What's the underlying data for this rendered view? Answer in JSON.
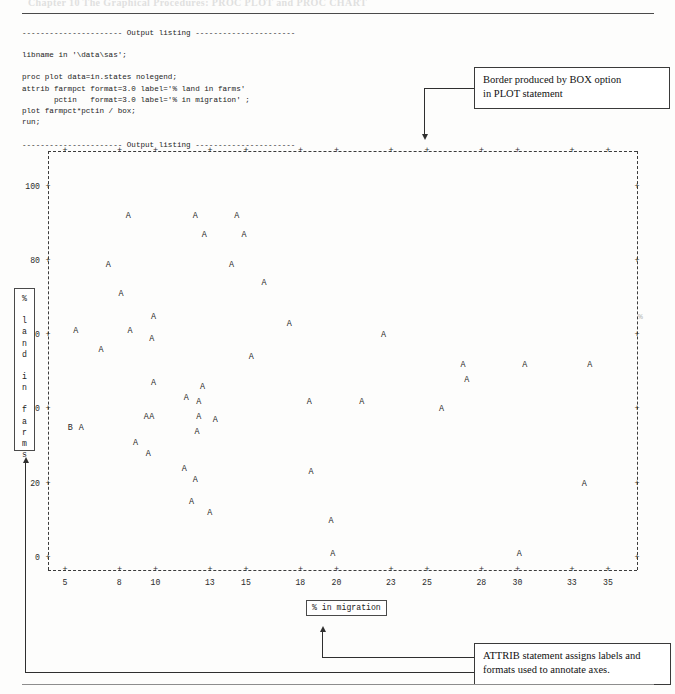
{
  "page": {
    "running_head": "Chapter 10    The Graphical Procedures: PROC PLOT and PROC CHART"
  },
  "code_listing": {
    "text": "---------------------- Output listing ----------------------\n\nlibname in '\\data\\sas';\n\nproc plot data=in.states nolegend;\nattrib farmpct format=3.0 label='% land in farms'\n       pctin   format=3.0 label='% in migration' ;\nplot farmpct*pctin / box;\nrun;\n\n---------------------- Output listing ----------------------"
  },
  "callouts": [
    {
      "id": "box-option",
      "line1": "Border produced by BOX option",
      "line2": "in PLOT statement"
    },
    {
      "id": "attrib",
      "line1": "ATTRIB statement assigns labels and",
      "line2": "formats used to annotate axes."
    }
  ],
  "chart_data": {
    "type": "scatter",
    "title": "",
    "xlabel": "% in migration",
    "ylabel": "% land in farms",
    "xlim": [
      3.5,
      36.5
    ],
    "ylim": [
      -5,
      107
    ],
    "xticks": [
      5,
      8,
      10,
      13,
      15,
      18,
      20,
      23,
      25,
      28,
      30,
      33,
      35
    ],
    "yticks": [
      0,
      20,
      40,
      60,
      80,
      100
    ],
    "grid": false,
    "legend": "none",
    "box_border": true,
    "marker_glyph": "A",
    "marker_note": "B denotes two coincident observations; 'AA' pairs are adjacent plot columns",
    "points": [
      {
        "label": "A",
        "x": 8.5,
        "y": 92
      },
      {
        "label": "A",
        "x": 12.2,
        "y": 92
      },
      {
        "label": "A",
        "x": 14.5,
        "y": 92
      },
      {
        "label": "A",
        "x": 12.7,
        "y": 87
      },
      {
        "label": "A",
        "x": 14.9,
        "y": 87
      },
      {
        "label": "A",
        "x": 7.4,
        "y": 79
      },
      {
        "label": "A",
        "x": 14.2,
        "y": 79
      },
      {
        "label": "A",
        "x": 16.0,
        "y": 74
      },
      {
        "label": "A",
        "x": 8.1,
        "y": 71
      },
      {
        "label": "A",
        "x": 9.9,
        "y": 65
      },
      {
        "label": "A",
        "x": 17.4,
        "y": 63
      },
      {
        "label": "A",
        "x": 5.6,
        "y": 61
      },
      {
        "label": "A",
        "x": 8.6,
        "y": 61
      },
      {
        "label": "A",
        "x": 22.6,
        "y": 60
      },
      {
        "label": "A",
        "x": 9.8,
        "y": 59
      },
      {
        "label": "A",
        "x": 7.0,
        "y": 56
      },
      {
        "label": "A",
        "x": 15.3,
        "y": 54
      },
      {
        "label": "A",
        "x": 27.0,
        "y": 52
      },
      {
        "label": "A",
        "x": 30.4,
        "y": 52
      },
      {
        "label": "A",
        "x": 34.0,
        "y": 52
      },
      {
        "label": "A",
        "x": 27.2,
        "y": 48
      },
      {
        "label": "A",
        "x": 9.9,
        "y": 47
      },
      {
        "label": "A",
        "x": 12.6,
        "y": 46
      },
      {
        "label": "A",
        "x": 11.7,
        "y": 43
      },
      {
        "label": "A",
        "x": 12.4,
        "y": 42
      },
      {
        "label": "A",
        "x": 18.5,
        "y": 42
      },
      {
        "label": "A",
        "x": 21.4,
        "y": 42
      },
      {
        "label": "A",
        "x": 25.8,
        "y": 40
      },
      {
        "label": "A",
        "x": 9.5,
        "y": 38
      },
      {
        "label": "A",
        "x": 9.8,
        "y": 38
      },
      {
        "label": "A",
        "x": 12.4,
        "y": 38
      },
      {
        "label": "A",
        "x": 13.3,
        "y": 37
      },
      {
        "label": "B",
        "x": 5.3,
        "y": 35
      },
      {
        "label": "A",
        "x": 5.9,
        "y": 35
      },
      {
        "label": "A",
        "x": 12.3,
        "y": 34
      },
      {
        "label": "A",
        "x": 8.9,
        "y": 31
      },
      {
        "label": "A",
        "x": 9.6,
        "y": 28
      },
      {
        "label": "A",
        "x": 11.6,
        "y": 24
      },
      {
        "label": "A",
        "x": 18.6,
        "y": 23
      },
      {
        "label": "A",
        "x": 12.2,
        "y": 21
      },
      {
        "label": "A",
        "x": 33.7,
        "y": 20
      },
      {
        "label": "A",
        "x": 12.0,
        "y": 15
      },
      {
        "label": "A",
        "x": 13.0,
        "y": 12
      },
      {
        "label": "A",
        "x": 19.7,
        "y": 10
      },
      {
        "label": "A",
        "x": 19.8,
        "y": 1
      },
      {
        "label": "A",
        "x": 30.1,
        "y": 1
      }
    ]
  }
}
